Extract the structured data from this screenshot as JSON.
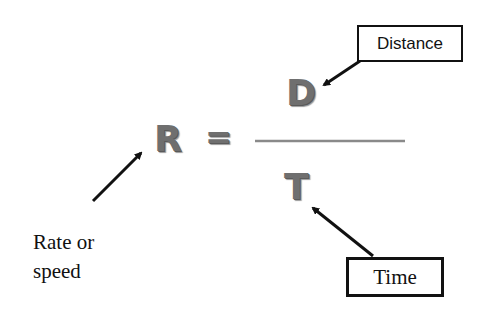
{
  "formula": {
    "variable_rate": "R",
    "equals_sign": "=",
    "numerator": "D",
    "denominator": "T"
  },
  "labels": {
    "distance": "Distance",
    "time": "Time",
    "rate_line1": "Rate or",
    "rate_line2": "speed"
  },
  "colors": {
    "letters": "#6f6f6f",
    "fraction_bar": "#8a8a8a",
    "arrows": "#111111"
  }
}
